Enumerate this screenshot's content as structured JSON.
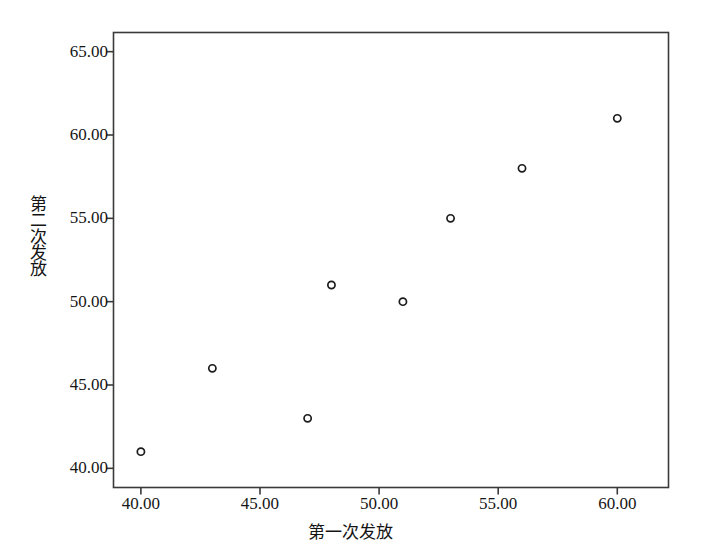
{
  "chart_data": {
    "type": "scatter",
    "title": "",
    "xlabel": "第一次发放",
    "ylabel": "第二次发放",
    "xlim": [
      38.85,
      62.15
    ],
    "ylim": [
      38.85,
      66.15
    ],
    "xticks": [
      "40.00",
      "45.00",
      "50.00",
      "55.00",
      "60.00"
    ],
    "xtick_values": [
      40,
      45,
      50,
      55,
      60
    ],
    "yticks": [
      "40.00",
      "45.00",
      "50.00",
      "55.00",
      "60.00",
      "65.00"
    ],
    "ytick_values": [
      40,
      45,
      50,
      55,
      60,
      65
    ],
    "grid": false,
    "legend": null,
    "marker": "open-circle",
    "marker_color": "#1c1c1c",
    "points": [
      {
        "x": 40,
        "y": 41
      },
      {
        "x": 43,
        "y": 46
      },
      {
        "x": 47,
        "y": 43
      },
      {
        "x": 48,
        "y": 51
      },
      {
        "x": 51,
        "y": 50
      },
      {
        "x": 53,
        "y": 55
      },
      {
        "x": 56,
        "y": 58
      },
      {
        "x": 60,
        "y": 61
      }
    ],
    "x": [
      40,
      43,
      47,
      48,
      51,
      53,
      56,
      60
    ],
    "y": [
      41,
      46,
      43,
      51,
      50,
      55,
      58,
      61
    ]
  },
  "ylabel_chars": [
    "第",
    "二",
    "次",
    "发",
    "放"
  ],
  "style": {
    "frame_color": "#3a3a3a",
    "background": "#ffffff",
    "text_color": "#161616"
  }
}
